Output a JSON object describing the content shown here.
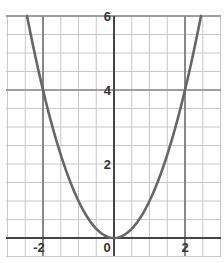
{
  "chart_data": {
    "type": "line",
    "title": "",
    "xlabel": "",
    "ylabel": "",
    "function": "y = x^2",
    "series": [
      {
        "name": "y = x^2",
        "x": [
          -2.45,
          -2,
          -1.5,
          -1,
          -0.5,
          0,
          0.5,
          1,
          1.5,
          2,
          2.45
        ],
        "values": [
          6.0,
          4,
          2.25,
          1,
          0.25,
          0,
          0.25,
          1,
          2.25,
          4,
          6.0
        ]
      }
    ],
    "xlim": [
      -3.0,
      3.1
    ],
    "ylim": [
      -0.4,
      6.0
    ],
    "x_ticks": [
      {
        "value": -2,
        "label": "-2"
      },
      {
        "value": 0,
        "label": "0"
      },
      {
        "value": 2,
        "label": "2"
      }
    ],
    "y_ticks": [
      {
        "value": 2,
        "label": "2"
      },
      {
        "value": 4,
        "label": "4"
      },
      {
        "value": 6,
        "label": "6"
      }
    ],
    "grid": true,
    "grid_step": 0.5,
    "emphasized_lines": {
      "x": [
        -2,
        0,
        2
      ],
      "y": [
        0,
        4,
        6
      ]
    },
    "legend": null,
    "colors": {
      "curve": "#666666",
      "axis": "#444444",
      "grid": "#c8c8c8",
      "major_grid": "#888888"
    }
  }
}
